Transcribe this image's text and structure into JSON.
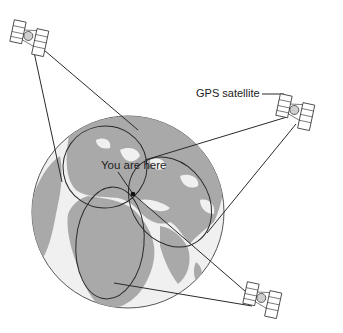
{
  "diagram": {
    "labels": {
      "you_are_here": "You are here",
      "gps_satellite": "GPS satellite"
    },
    "colors": {
      "background": "#ffffff",
      "ocean": "#f0f0f0",
      "land": "#a9a9a9",
      "line": "#2a2a2a"
    },
    "satellites": [
      {
        "name": "satellite-top-left",
        "x": 30,
        "y": 35
      },
      {
        "name": "satellite-right",
        "x": 297,
        "y": 113
      },
      {
        "name": "satellite-bottom-right",
        "x": 263,
        "y": 300
      }
    ],
    "position": {
      "x": 133,
      "y": 194
    }
  }
}
